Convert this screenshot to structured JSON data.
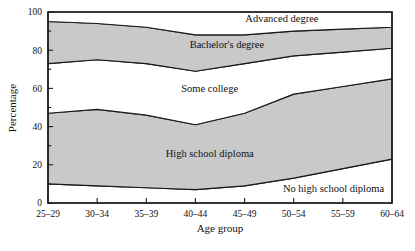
{
  "chart_data": {
    "type": "area",
    "title": "",
    "subtitle": "",
    "xlabel": "Age group",
    "ylabel": "Percentage",
    "categories": [
      "25–29",
      "30–34",
      "35–39",
      "40–44",
      "45–49",
      "50–54",
      "55–59",
      "60–64"
    ],
    "ylim": [
      0,
      100
    ],
    "yticks": [
      0,
      20,
      40,
      60,
      80,
      100
    ],
    "ytick_labels": [
      "0",
      "20",
      "40",
      "60",
      "80",
      "100"
    ],
    "grid": false,
    "legend_position": "inline-band-labels",
    "stacked": true,
    "stack_order": "bottom-to-top",
    "series": [
      {
        "name": "No high school diploma",
        "shaded": false,
        "values": [
          10,
          9,
          8,
          7,
          9,
          13,
          18,
          23
        ],
        "cumulative_top": [
          10,
          9,
          8,
          7,
          9,
          13,
          18,
          23
        ]
      },
      {
        "name": "High school diploma",
        "shaded": true,
        "values": [
          37,
          40,
          38,
          34,
          38,
          44,
          43,
          42
        ],
        "cumulative_top": [
          47,
          49,
          46,
          41,
          47,
          57,
          61,
          65
        ]
      },
      {
        "name": "Some college",
        "shaded": false,
        "values": [
          26,
          26,
          27,
          28,
          26,
          20,
          18,
          16
        ],
        "cumulative_top": [
          73,
          75,
          73,
          69,
          73,
          77,
          79,
          81
        ]
      },
      {
        "name": "Bachelor's degree",
        "shaded": true,
        "values": [
          22,
          19,
          19,
          19,
          15,
          13,
          12,
          11
        ],
        "cumulative_top": [
          95,
          94,
          92,
          88,
          88,
          90,
          91,
          92
        ]
      },
      {
        "name": "Advanced degree",
        "shaded": false,
        "values": [
          5,
          6,
          8,
          12,
          12,
          10,
          9,
          8
        ],
        "cumulative_top": [
          100,
          100,
          100,
          100,
          100,
          100,
          100,
          100
        ]
      }
    ],
    "band_labels": [
      {
        "text": "Advanced degree",
        "x_pct": 68,
        "y_pct": 95
      },
      {
        "text": "Bachelor's degree",
        "x_pct": 52,
        "y_pct": 81
      },
      {
        "text": "Some college",
        "x_pct": 47,
        "y_pct": 58
      },
      {
        "text": "High school diploma",
        "x_pct": 47,
        "y_pct": 24
      },
      {
        "text": "No high school diploma",
        "x_pct": 83,
        "y_pct": 6
      }
    ]
  },
  "colors": {
    "shaded_band": "#c9c9c9",
    "plain_band": "#ffffff",
    "outline": "#1a1a1a",
    "text": "#111111",
    "page_background": "#ffffff"
  },
  "caption": {
    "text": ""
  }
}
